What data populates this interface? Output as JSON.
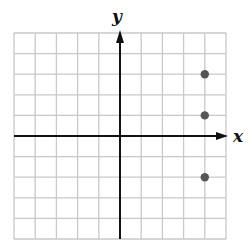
{
  "chart_data": {
    "type": "scatter",
    "title": "",
    "xlabel": "x",
    "ylabel": "y",
    "xlim": [
      -5,
      5
    ],
    "ylim": [
      -5,
      5
    ],
    "grid": true,
    "grid_step": 1,
    "tick_labels": false,
    "points": [
      {
        "x": 4,
        "y": 3
      },
      {
        "x": 4,
        "y": 1
      },
      {
        "x": 4,
        "y": -2
      }
    ]
  },
  "colors": {
    "grid": "#c8c8c8",
    "axis": "#111111",
    "point": "#555555"
  }
}
